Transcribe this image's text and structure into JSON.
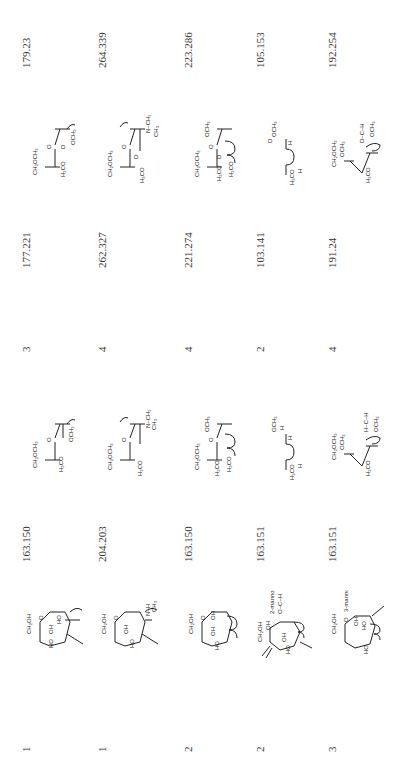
{
  "table": {
    "orientation": "rotated-90-ccw",
    "rows": [
      {
        "index": "1",
        "residue_mass": "163.150",
        "count": "3",
        "derivative_mass_a": "177.221",
        "derivative_mass_b": "179.23",
        "structure_1": "hexose ring (CH2OH, OH, HO) with arrows",
        "structure_2": "CH2OCH3 / H / H3CO open chain",
        "structure_3": "CH2OCH3 / OCH3 / D / H3CO"
      },
      {
        "index": "1",
        "residue_mass": "204.203",
        "count": "4",
        "derivative_mass_a": "262.327",
        "derivative_mass_b": "264.339",
        "structure_1": "HexNAc ring (CH2OH, N-H, C=O, CH3)",
        "structure_2": "CH2OCH3 / N-CH3 / C=O / CH3 / H3CO",
        "structure_3": "CH2OCH3 / N-CH3 / D / H3CO / C=O / CH3"
      },
      {
        "index": "2",
        "residue_mass": "163.150",
        "count": "4",
        "derivative_mass_a": "221.274",
        "derivative_mass_b": "223.286",
        "structure_1": "hexose ring (CH2OH, OH, OH)",
        "structure_2": "CH2OCH3 / OCH3 / H3CO",
        "structure_3": "CH2OCH3 / OCH3 / D / H3CO"
      },
      {
        "index": "2",
        "residue_mass": "163.151",
        "count": "2",
        "derivative_mass_a": "103.141",
        "derivative_mass_b": "105.153",
        "structure_1": "2-mannose",
        "structure_1_label": "2-mannose",
        "structure_2": "OCH3 / H / H3CO",
        "structure_3": "D / OCH3 / H3CO"
      },
      {
        "index": "3",
        "residue_mass": "163.151",
        "count": "4",
        "derivative_mass_a": "191.24",
        "derivative_mass_b": "192.254",
        "structure_1": "3-mannose",
        "structure_1_label": "3-mannose",
        "structure_2": "CH2OCH3 / OCH3 / H3CO",
        "structure_3": "CH2OCH3 / OCH3 / D / H3CO"
      }
    ]
  },
  "chem_labels": {
    "ch2och3": "CH₂OCH₃",
    "ch2oh": "CH₂OH",
    "och3": "OCH₃",
    "h3co": "H₃CO",
    "ch3": "CH₃",
    "oh": "OH",
    "ho": "HO",
    "h": "H",
    "d": "D",
    "o": "O",
    "n_ch3": "N–CH₃",
    "n_h": "N–H",
    "c": "C"
  }
}
